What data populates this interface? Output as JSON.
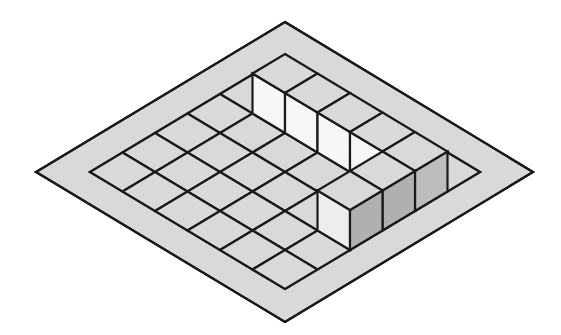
{
  "figure": {
    "type": "isometric-block-diagram",
    "canvas": {
      "width": 561,
      "height": 335,
      "background": "#ffffff"
    },
    "colors": {
      "plate_fill": "#d9d9d9",
      "cell_fill": "#d9d9d9",
      "stroke": "#1a1a1a",
      "cube_top": "#d9d9d9",
      "cube_left_face_light": "#f7f7f7",
      "cube_left_face_light2": "#ededed",
      "cube_right_face_dark": "#b0b0b0",
      "cube_right_face_dark2": "#a8a8a8",
      "cube_corner_right_face": "#bdbdbd"
    },
    "stroke_width": 2.2,
    "geometry": {
      "outer_plate": {
        "top": [
          285,
          22
        ],
        "left": [
          36,
          172
        ],
        "right": [
          533,
          172
        ],
        "bottom": [
          285,
          322
        ]
      },
      "inner_grid": {
        "origin_top": [
          285,
          55
        ],
        "left": [
          90,
          172
        ],
        "right": [
          480,
          172
        ],
        "bottom": [
          285,
          290
        ],
        "rows": 6,
        "cols": 6,
        "step_right": [
          32.5,
          19.5
        ],
        "step_left": [
          -32.5,
          19.5
        ]
      },
      "cube_height": 40
    },
    "raised_cubes": {
      "description": "A contiguous V-shaped ridge of raised unit cubes one level high",
      "count": 8,
      "left_arm_cells": [
        {
          "col": 0,
          "row": 2
        },
        {
          "col": 1,
          "row": 2
        },
        {
          "col": 2,
          "row": 2
        },
        {
          "col": 3,
          "row": 2
        },
        {
          "col": 4,
          "row": 2
        }
      ],
      "right_arm_cells": [
        {
          "col": 4,
          "row": 1
        },
        {
          "col": 4,
          "row": 0
        }
      ],
      "corner_cell": {
        "col": 4,
        "row": 2
      }
    }
  }
}
